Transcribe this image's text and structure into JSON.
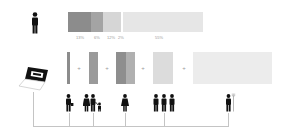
{
  "top_row": {
    "icon": "person-icon",
    "bar": {
      "segments": [
        {
          "label": "13%",
          "color": "#8c8c8c",
          "width": 23
        },
        {
          "label": "6%",
          "color": "#a4a4a4",
          "width": 12
        },
        {
          "label": "12%",
          "color": "#d6d6d6",
          "width": 18
        },
        {
          "label": "2%",
          "color": "#ffffff",
          "width": 2
        },
        {
          "label": "55%",
          "color": "#e6e6e6",
          "width": 80
        }
      ]
    }
  },
  "bottom_row": {
    "source_icon": "laptop-icon",
    "plus_symbol": "+",
    "groups": [
      {
        "name": "worker",
        "icon": "person-briefcase-icon",
        "color": "#8c8c8c"
      },
      {
        "name": "family",
        "icon": "family-icon",
        "color": "#9a9a9a"
      },
      {
        "name": "woman",
        "icon": "woman-icon",
        "color": "#a8a8a8"
      },
      {
        "name": "group",
        "icon": "three-people-icon",
        "color": "#dcdcdc"
      },
      {
        "name": "farmer",
        "icon": "farmer-pitchfork-icon",
        "color": "#ececec"
      }
    ]
  },
  "colors": {
    "icon": "#111111",
    "connector": "#c4c4c4",
    "label": "#9a9a9a"
  }
}
